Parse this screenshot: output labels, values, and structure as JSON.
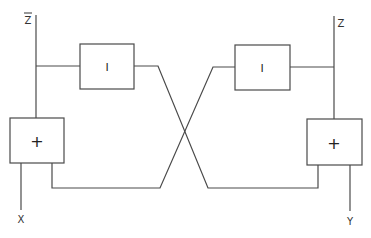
{
  "diagram": {
    "type": "cross-coupled signal flow block diagram",
    "nodes": {
      "left_top_port": {
        "label": "Z",
        "overline": true
      },
      "right_top_port": {
        "label": "Z"
      },
      "left_bottom_port": {
        "label": "X"
      },
      "right_bottom_port": {
        "label": "Y"
      },
      "left_block": {
        "label": "I"
      },
      "right_block": {
        "label": "I"
      },
      "left_adder": {
        "label": "+"
      },
      "right_adder": {
        "label": "+"
      }
    },
    "edges": [
      {
        "from": "left_top_port",
        "to": "left_adder"
      },
      {
        "from": "left_top_port",
        "to": "left_block"
      },
      {
        "from": "left_block",
        "to": "right_adder",
        "note": "crosses over"
      },
      {
        "from": "right_top_port",
        "to": "right_adder"
      },
      {
        "from": "right_top_port",
        "to": "right_block"
      },
      {
        "from": "right_block",
        "to": "left_adder",
        "note": "crosses over"
      },
      {
        "from": "left_adder",
        "to": "left_bottom_port"
      },
      {
        "from": "right_adder",
        "to": "right_bottom_port"
      }
    ]
  }
}
